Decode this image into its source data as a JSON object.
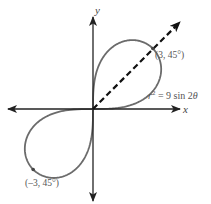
{
  "figure": {
    "equation": {
      "lhs_var": "r",
      "exponent": "2",
      "rhs": " = 9 sin 2",
      "theta": "θ",
      "full_text": "r² = 9 sin 2θ"
    },
    "axes": {
      "x_label": "x",
      "y_label": "y"
    },
    "points": [
      {
        "label": "(3, 45°)",
        "r": 3,
        "theta_deg": 45
      },
      {
        "label": "(–3, 45°)",
        "r": -3,
        "theta_deg": 45
      }
    ],
    "ray": {
      "theta_deg": 45,
      "style": "dashed",
      "arrow": true
    },
    "colors": {
      "curve": "#6b6b6b",
      "axes": "#222222",
      "ray": "#111111",
      "labels": "#555555"
    }
  },
  "chart_data": {
    "type": "line",
    "title": "",
    "subtitle": "",
    "curve": "lemniscate",
    "equation": "r^2 = 9 sin 2θ",
    "coordinate_system": "polar",
    "xlabel": "x",
    "ylabel": "y",
    "grid": false,
    "legend": null,
    "annotations": [
      {
        "text": "(3, 45°)",
        "polar": [
          3,
          45
        ],
        "cartesian": [
          2.121,
          2.121
        ]
      },
      {
        "text": "(–3, 45°)",
        "polar": [
          -3,
          45
        ],
        "cartesian": [
          -2.121,
          -2.121
        ]
      },
      {
        "text": "r² = 9 sin 2θ",
        "position": "right of upper loop"
      }
    ],
    "series": [
      {
        "name": "r^2 = 9 sin 2θ",
        "theta_range_deg": [
          0,
          90
        ],
        "note": "two loops in quadrants I and III; max |r| = 3 at θ = 45°",
        "sample_points_polar": [
          {
            "theta": 0,
            "r": 0
          },
          {
            "theta": 15,
            "r": 2.121
          },
          {
            "theta": 30,
            "r": 2.792
          },
          {
            "theta": 45,
            "r": 3
          },
          {
            "theta": 60,
            "r": 2.792
          },
          {
            "theta": 75,
            "r": 2.121
          },
          {
            "theta": 90,
            "r": 0
          }
        ]
      }
    ],
    "xlim": [
      -3.1,
      3.1
    ],
    "ylim": [
      -3.3,
      3.3
    ]
  }
}
